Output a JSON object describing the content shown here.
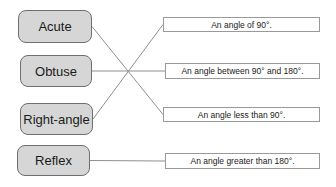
{
  "canvas": {
    "width": 336,
    "height": 187,
    "background": "#ffffff"
  },
  "colors": {
    "term_fill": "#d6d6d6",
    "term_border": "#6e6e6e",
    "definition_fill": "#ffffff",
    "definition_border": "#999999",
    "connector": "#8f8f8f",
    "text": "#1a1a1a"
  },
  "terms": [
    {
      "label": "Acute"
    },
    {
      "label": "Obtuse"
    },
    {
      "label": "Right-angle"
    },
    {
      "label": "Reflex"
    }
  ],
  "definitions": [
    {
      "label": "An angle of 90°."
    },
    {
      "label": "An angle between 90° and 180°."
    },
    {
      "label": "An angle less than 90°."
    },
    {
      "label": "An angle greater than 180°."
    }
  ],
  "connections": [
    {
      "term_index": 0,
      "definition_index": 2
    },
    {
      "term_index": 1,
      "definition_index": 1
    },
    {
      "term_index": 2,
      "definition_index": 0
    },
    {
      "term_index": 3,
      "definition_index": 3
    }
  ]
}
